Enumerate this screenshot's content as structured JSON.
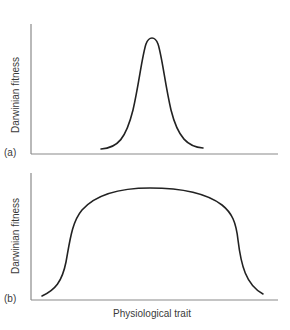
{
  "figure": {
    "panels": [
      {
        "id": "a",
        "label": "(a)",
        "ylabel": "Darwinian fitness",
        "curve": "narrow bell-shaped peak"
      },
      {
        "id": "b",
        "label": "(b)",
        "ylabel": "Darwinian fitness",
        "curve": "broad plateau"
      }
    ],
    "xlabel": "Physiological trait",
    "colors": {
      "axis": "#8a8a8a",
      "curve": "#222222",
      "text": "#3a3a3a"
    }
  }
}
